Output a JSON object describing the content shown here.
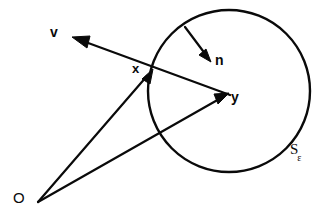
{
  "figure": {
    "type": "geometry-diagram",
    "background_color": "#ffffff",
    "stroke_color": "#0a0a0a",
    "width": 330,
    "height": 216
  },
  "labels": {
    "v": "v",
    "x": "x",
    "n": "n",
    "y": "y",
    "O": "O",
    "S": "S",
    "S_subscript": "ε"
  },
  "geometry": {
    "circle": {
      "name": "S-epsilon",
      "center_x": 229,
      "center_y": 91,
      "radius": 81,
      "stroke_width": 2.4
    },
    "points": {
      "origin": {
        "label": "O",
        "x": 38,
        "y": 202
      },
      "boundary_point": {
        "label": "x",
        "x": 152,
        "y": 70
      },
      "center_point": {
        "label": "y",
        "x": 229,
        "y": 93
      }
    },
    "vectors": [
      {
        "name": "v",
        "label": "v",
        "from_x": 230,
        "from_y": 95,
        "to_x": 74,
        "to_y": 38,
        "arrowhead": "end",
        "passes_through": "x"
      },
      {
        "name": "n",
        "label": "n",
        "from_x": 185,
        "from_y": 27,
        "to_x": 210,
        "to_y": 60,
        "arrowhead": "end"
      },
      {
        "name": "Ox",
        "label": "",
        "from_x": 38,
        "from_y": 202,
        "to_x": 152,
        "to_y": 70,
        "arrowhead": "end"
      },
      {
        "name": "Oy",
        "label": "",
        "from_x": 38,
        "from_y": 202,
        "to_x": 228,
        "to_y": 94,
        "arrowhead": "end"
      }
    ]
  }
}
